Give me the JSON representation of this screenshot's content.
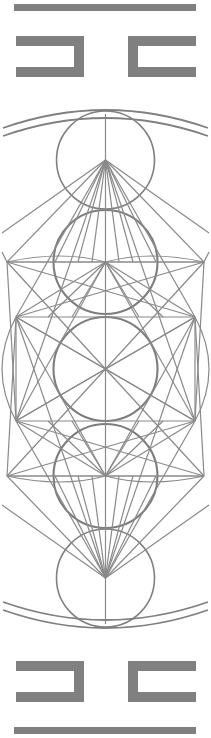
{
  "artwork": {
    "title": "Sacred Geometry Ornament Panel",
    "style": "metatron-cube-vertical-panel",
    "canvas": {
      "width": 211,
      "height": 738
    },
    "colors": {
      "background": "#ffffff",
      "ink": "#808080",
      "ink_thin": "#8a8a8a",
      "ink_thick": "#7d7d7d"
    },
    "center": {
      "x": 105.5,
      "y": 369
    },
    "rules": {
      "top_bar": {
        "x": 14,
        "y": 4,
        "width": 182,
        "height": 7
      },
      "bottom_bar": {
        "x": 14,
        "y": 727,
        "width": 182,
        "height": 7
      }
    },
    "brackets": {
      "top_left": {
        "x": 16,
        "y": 36,
        "width": 68,
        "height": 41,
        "thickness": 10,
        "open_side": "left",
        "glyph": "⊐"
      },
      "top_right": {
        "x": 128,
        "y": 36,
        "width": 68,
        "height": 41,
        "thickness": 10,
        "open_side": "right",
        "glyph": "⊏"
      },
      "bottom_left": {
        "x": 16,
        "y": 661,
        "width": 68,
        "height": 41,
        "thickness": 10,
        "open_side": "left",
        "glyph": "⊐"
      },
      "bottom_right": {
        "x": 128,
        "y": 661,
        "width": 68,
        "height": 41,
        "thickness": 10,
        "open_side": "right",
        "glyph": "⊏"
      }
    },
    "circles": [
      {
        "name": "upper-small-circle",
        "cx": 105.5,
        "cy": 160,
        "r": 49
      },
      {
        "name": "upper-large-circle",
        "cx": 105.5,
        "cy": 262,
        "r": 52
      },
      {
        "name": "central-circle",
        "cx": 105.5,
        "cy": 369,
        "r": 52
      },
      {
        "name": "lower-large-circle",
        "cx": 105.5,
        "cy": 476,
        "r": 52
      },
      {
        "name": "lower-small-circle",
        "cx": 105.5,
        "cy": 578,
        "r": 49
      }
    ],
    "arcs": {
      "top_outer": {
        "name": "top-outer-arc",
        "sweep": "down",
        "chord_y": 110
      },
      "top_inner": {
        "name": "top-inner-arc",
        "sweep": "down",
        "chord_y": 118
      },
      "bottom_outer": {
        "name": "bottom-outer-arc",
        "sweep": "up",
        "chord_y": 628
      },
      "bottom_inner": {
        "name": "bottom-inner-arc",
        "sweep": "up",
        "chord_y": 620
      }
    },
    "grid": {
      "vertical_axis": {
        "x": 105.5,
        "y1": 114,
        "y2": 624
      },
      "horizontal_rules": [
        {
          "name": "upper-wide-rule",
          "y": 262,
          "x1": 7,
          "x2": 204
        },
        {
          "name": "upper-square-rule",
          "y": 317,
          "x1": 16,
          "x2": 195
        },
        {
          "name": "lower-square-rule",
          "y": 421,
          "x1": 16,
          "x2": 195
        },
        {
          "name": "lower-wide-rule",
          "y": 476,
          "x1": 7,
          "x2": 204
        }
      ],
      "square": {
        "x": 16,
        "y": 317,
        "width": 179,
        "height": 104
      }
    },
    "nodes": [
      {
        "name": "node-top-apex",
        "x": 105.5,
        "y": 160
      },
      {
        "name": "node-upper-left",
        "x": 16,
        "y": 317
      },
      {
        "name": "node-upper-right",
        "x": 195,
        "y": 317
      },
      {
        "name": "node-mid-left",
        "x": 7,
        "y": 262
      },
      {
        "name": "node-mid-right",
        "x": 204,
        "y": 262
      },
      {
        "name": "node-center",
        "x": 105.5,
        "y": 369
      },
      {
        "name": "node-lower-left",
        "x": 16,
        "y": 421
      },
      {
        "name": "node-lower-right",
        "x": 195,
        "y": 421
      },
      {
        "name": "node-bottom-apex",
        "x": 105.5,
        "y": 578
      },
      {
        "name": "node-upper-hub",
        "x": 105.5,
        "y": 262
      },
      {
        "name": "node-lower-hub",
        "x": 105.5,
        "y": 476
      }
    ]
  }
}
